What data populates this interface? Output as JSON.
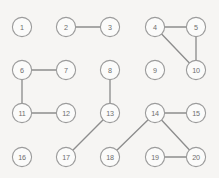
{
  "canvas": {
    "width": 219,
    "height": 178,
    "background_color": "#f6f5f3"
  },
  "style": {
    "node_radius": 9.6,
    "node_fill": "#fbfbfa",
    "node_stroke": "#9b9b9b",
    "node_stroke_width": 1.1,
    "label_color": "#6e6e6e",
    "label_font_size": 7.2,
    "edge_color": "#8d8d8d",
    "edge_width": 1.35
  },
  "graph": {
    "type": "undirected-node-link-grid",
    "node_count": 20,
    "edge_count": 11,
    "nodes": [
      {
        "id": 1,
        "label": "1",
        "x": 22,
        "y": 27
      },
      {
        "id": 2,
        "label": "2",
        "x": 66,
        "y": 27
      },
      {
        "id": 3,
        "label": "3",
        "x": 110,
        "y": 27
      },
      {
        "id": 4,
        "label": "4",
        "x": 155,
        "y": 27
      },
      {
        "id": 5,
        "label": "5",
        "x": 196,
        "y": 27
      },
      {
        "id": 6,
        "label": "6",
        "x": 22,
        "y": 70
      },
      {
        "id": 7,
        "label": "7",
        "x": 66,
        "y": 70
      },
      {
        "id": 8,
        "label": "8",
        "x": 110,
        "y": 70
      },
      {
        "id": 9,
        "label": "9",
        "x": 155,
        "y": 70
      },
      {
        "id": 10,
        "label": "10",
        "x": 196,
        "y": 70
      },
      {
        "id": 11,
        "label": "11",
        "x": 22,
        "y": 113
      },
      {
        "id": 12,
        "label": "12",
        "x": 66,
        "y": 113
      },
      {
        "id": 13,
        "label": "13",
        "x": 110,
        "y": 113
      },
      {
        "id": 14,
        "label": "14",
        "x": 155,
        "y": 113
      },
      {
        "id": 15,
        "label": "15",
        "x": 196,
        "y": 113
      },
      {
        "id": 16,
        "label": "16",
        "x": 22,
        "y": 157
      },
      {
        "id": 17,
        "label": "17",
        "x": 66,
        "y": 157
      },
      {
        "id": 18,
        "label": "18",
        "x": 110,
        "y": 157
      },
      {
        "id": 19,
        "label": "19",
        "x": 155,
        "y": 157
      },
      {
        "id": 20,
        "label": "20",
        "x": 196,
        "y": 157
      }
    ],
    "edges": [
      {
        "source": 2,
        "target": 3
      },
      {
        "source": 4,
        "target": 5
      },
      {
        "source": 4,
        "target": 10
      },
      {
        "source": 5,
        "target": 10
      },
      {
        "source": 6,
        "target": 7
      },
      {
        "source": 6,
        "target": 11
      },
      {
        "source": 11,
        "target": 12
      },
      {
        "source": 8,
        "target": 13
      },
      {
        "source": 13,
        "target": 17
      },
      {
        "source": 14,
        "target": 15
      },
      {
        "source": 14,
        "target": 18
      },
      {
        "source": 14,
        "target": 20
      },
      {
        "source": 19,
        "target": 20
      }
    ],
    "isolated_nodes": [
      1,
      9,
      16
    ]
  }
}
